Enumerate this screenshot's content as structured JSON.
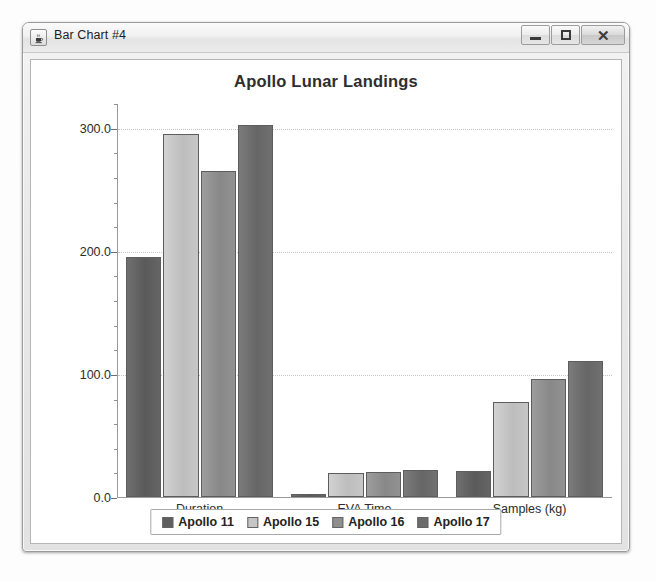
{
  "window": {
    "title": "Bar Chart #4",
    "icon": "java-cup-icon",
    "controls": {
      "minimize": "–",
      "maximize": "□",
      "close": "✕"
    }
  },
  "chart_data": {
    "type": "bar",
    "title": "Apollo Lunar Landings",
    "xlabel": "",
    "ylabel": "",
    "categories": [
      "Duration",
      "EVA Time",
      "Samples (kg)"
    ],
    "series": [
      {
        "name": "Apollo 11",
        "color": "#5f5f5f",
        "values": [
          195.0,
          2.5,
          21.5
        ]
      },
      {
        "name": "Apollo 15",
        "color": "#c6c6c6",
        "values": [
          295.0,
          19.5,
          77.0
        ]
      },
      {
        "name": "Apollo 16",
        "color": "#8f8f8f",
        "values": [
          265.0,
          20.5,
          95.5
        ]
      },
      {
        "name": "Apollo 17",
        "color": "#6c6c6c",
        "values": [
          302.0,
          22.0,
          110.5
        ]
      }
    ],
    "ylim": [
      0.0,
      320.0
    ],
    "yticks": [
      0.0,
      100.0,
      200.0,
      300.0
    ],
    "ytick_labels": [
      "0.0",
      "100.0",
      "200.0",
      "300.0"
    ],
    "minor_ticks_per_interval": 5,
    "grid": true,
    "legend_position": "bottom"
  }
}
